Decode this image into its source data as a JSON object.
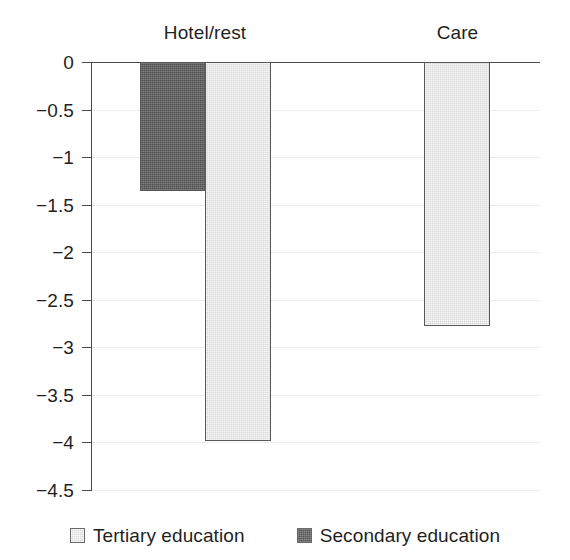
{
  "chart_data": {
    "type": "bar",
    "title": "",
    "subtitle": "",
    "xlabel": "",
    "ylabel": "",
    "categories": [
      "Hotel/rest",
      "Care"
    ],
    "series": [
      {
        "name": "Tertiary education",
        "color": "#d7d7d7",
        "values": [
          -3.98,
          -2.78
        ]
      },
      {
        "name": "Secondary education",
        "color": "#4f4f4f",
        "values": [
          -1.36,
          null
        ]
      }
    ],
    "ylim": [
      -4.5,
      0
    ],
    "ytick_values": [
      0,
      -0.5,
      -1,
      -1.5,
      -2,
      -2.5,
      -3,
      -3.5,
      -4,
      -4.5
    ],
    "ytick_labels": [
      "0",
      "−0.5",
      "−1",
      "−1.5",
      "−2",
      "−2.5",
      "−3",
      "−3.5",
      "−4",
      "−4.5"
    ],
    "grid": true,
    "grid_axis": "y",
    "legend_position": "bottom",
    "orientation": "vertical",
    "bar_count": 3
  },
  "axis": {
    "y_labels": [
      {
        "text": "0",
        "value": 0
      },
      {
        "text": "−0.5",
        "value": -0.5
      },
      {
        "text": "−1",
        "value": -1
      },
      {
        "text": "−1.5",
        "value": -1.5
      },
      {
        "text": "−2",
        "value": -2
      },
      {
        "text": "−2.5",
        "value": -2.5
      },
      {
        "text": "−3",
        "value": -3
      },
      {
        "text": "−3.5",
        "value": -3.5
      },
      {
        "text": "−4",
        "value": -4
      },
      {
        "text": "−4.5",
        "value": -4.5
      }
    ]
  },
  "groups": [
    {
      "label": "Hotel/rest"
    },
    {
      "label": "Care"
    }
  ],
  "legend": {
    "items": [
      {
        "label": "Tertiary education",
        "series": "tertiary"
      },
      {
        "label": "Secondary education",
        "series": "secondary"
      }
    ]
  },
  "colors": {
    "tertiary": "#d7d7d7",
    "secondary": "#4f4f4f",
    "axis": "#4a4a4a",
    "grid": "#ededed",
    "text": "#1f1f1f",
    "background": "#ffffff"
  }
}
